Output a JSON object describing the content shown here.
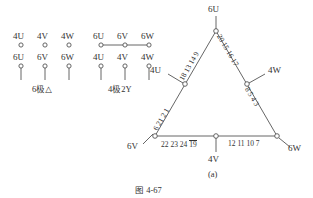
{
  "figure": {
    "caption": "图 4-67",
    "subfigure_label": "(a)"
  },
  "terminal_blocks": [
    {
      "name": "delta-block",
      "block_label": "6极△",
      "top_row": [
        "4U",
        "4V",
        "4W"
      ],
      "bottom_row": [
        "6U",
        "6V",
        "6W"
      ],
      "top_row_linked": false
    },
    {
      "name": "star-block",
      "block_label": "4极2Y",
      "top_row": [
        "6U",
        "6V",
        "6W"
      ],
      "bottom_row": [
        "4U",
        "4V",
        "4W"
      ],
      "top_row_linked": true
    }
  ],
  "triangle": {
    "vertex_labels": {
      "top": "6U",
      "bottom_left": "6V",
      "bottom_right": "6W"
    },
    "tap_labels": {
      "left": "4U",
      "right": "4W",
      "bottom": "4V"
    },
    "edge_numbers": {
      "upper_left": "18 13 14 9",
      "upper_right": "20 15 16 17",
      "lower_left": "6 21 2 1",
      "lower_right": "8 5 4 3",
      "bottom_left_segment": "22 23 24",
      "bottom_left_overlined": "19",
      "bottom_right_segment": "12 11 10 7"
    }
  },
  "colors": {
    "line": "#555555",
    "text": "#333333",
    "background": "#ffffff"
  }
}
